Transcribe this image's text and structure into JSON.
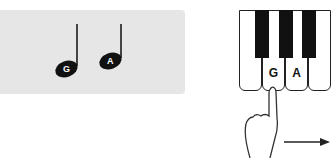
{
  "music_staff_panel": {
    "background": "#e6e6e6",
    "notes": [
      {
        "label": "G"
      },
      {
        "label": "A"
      }
    ]
  },
  "piano_diagram": {
    "white_keys": [
      {
        "label": ""
      },
      {
        "label": "G"
      },
      {
        "label": "A"
      },
      {
        "label": ""
      }
    ],
    "black_key_count": 3,
    "gesture": "finger-press-slide-right",
    "arrow_direction": "right"
  }
}
